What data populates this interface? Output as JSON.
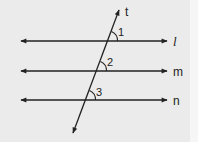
{
  "diagram": {
    "type": "parallel-lines-transversal",
    "colors": {
      "background": "#ebebeb",
      "stroke": "#222222"
    },
    "transversal": {
      "label": "t",
      "from": [
        73,
        133
      ],
      "to": [
        119,
        10
      ]
    },
    "lines": [
      {
        "id": "l",
        "label": "l",
        "y": 41,
        "x1": 21,
        "x2": 167
      },
      {
        "id": "m",
        "label": "m",
        "y": 71,
        "x1": 21,
        "x2": 167
      },
      {
        "id": "n",
        "label": "n",
        "y": 100,
        "x1": 21,
        "x2": 167
      }
    ],
    "angles": [
      {
        "label": "1",
        "at_line": "l"
      },
      {
        "label": "2",
        "at_line": "m"
      },
      {
        "label": "3",
        "at_line": "n"
      }
    ]
  }
}
